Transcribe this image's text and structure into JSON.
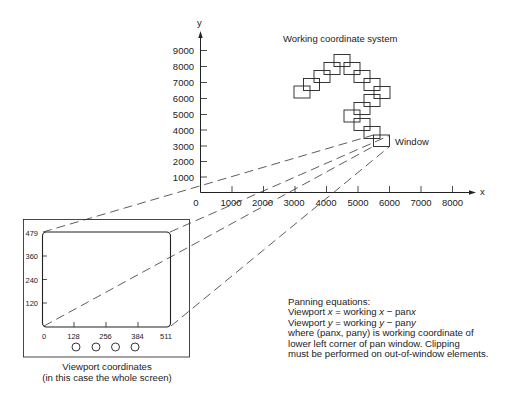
{
  "working_system": {
    "title": "Working coordinate system",
    "x_axis_label": "x",
    "y_axis_label": "y",
    "x_ticks": [
      "0",
      "1000",
      "2000",
      "3000",
      "4000",
      "5000",
      "6000",
      "7000",
      "8000"
    ],
    "y_ticks": [
      "1000",
      "2000",
      "3000",
      "4000",
      "5000",
      "6000",
      "7000",
      "8000",
      "9000"
    ],
    "window_label": "Window"
  },
  "viewport": {
    "y_ticks": [
      "479",
      "360",
      "240",
      "120"
    ],
    "x_ticks": [
      "0",
      "128",
      "256",
      "384",
      "511"
    ],
    "caption_line1": "Viewport coordinates",
    "caption_line2": "(in this case the whole screen)",
    "knob_count": 4
  },
  "panning": {
    "heading": "Panning equations:",
    "line1_prefix": "Viewport ",
    "line1_var": "x",
    "line1_mid": " = working ",
    "line1_var2": "x",
    "line1_suffix": " − pan",
    "line1_var3": "x",
    "line2_prefix": "Viewport ",
    "line2_var": "y",
    "line2_mid": " = working ",
    "line2_var2": "y",
    "line2_suffix": " − pan",
    "line2_var3": "y",
    "line3": "where (panx, pany) is working coordinate of",
    "line4": "lower left corner of pan window.  Clipping",
    "line5": "must be performed on out-of-window elements."
  }
}
